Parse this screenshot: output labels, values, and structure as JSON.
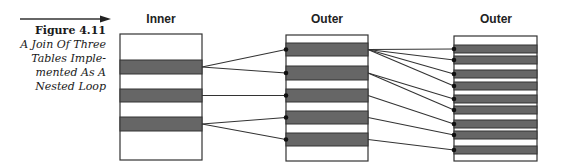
{
  "figure": {
    "number": "Figure 4.11",
    "caption_lines": [
      "A Join Of Three",
      "Tables Imple-",
      "mented As A",
      "Nested Loop"
    ]
  },
  "colors": {
    "row_fill": "#666666",
    "border": "#333333",
    "line": "#333333",
    "background": "#ffffff"
  },
  "tables": [
    {
      "id": "inner",
      "label": "Inner",
      "rows": 3
    },
    {
      "id": "outer1",
      "label": "Outer",
      "rows": 5
    },
    {
      "id": "outer2",
      "label": "Outer",
      "rows": 9
    }
  ],
  "connections": [
    {
      "from_table": 0,
      "from_row": 0,
      "to_table": 1,
      "to_rows": [
        0,
        1
      ]
    },
    {
      "from_table": 0,
      "from_row": 1,
      "to_table": 1,
      "to_rows": [
        2
      ]
    },
    {
      "from_table": 0,
      "from_row": 2,
      "to_table": 1,
      "to_rows": [
        3,
        4
      ]
    },
    {
      "from_table": 1,
      "from_row": 0,
      "to_table": 2,
      "to_rows": [
        0,
        1,
        2,
        3
      ]
    },
    {
      "from_table": 1,
      "from_row": 1,
      "to_table": 2,
      "to_rows": [
        4,
        5
      ]
    },
    {
      "from_table": 1,
      "from_row": 2,
      "to_table": 2,
      "to_rows": [
        6
      ]
    },
    {
      "from_table": 1,
      "from_row": 3,
      "to_table": 2,
      "to_rows": [
        7
      ]
    },
    {
      "from_table": 1,
      "from_row": 4,
      "to_table": 2,
      "to_rows": [
        8
      ]
    }
  ]
}
